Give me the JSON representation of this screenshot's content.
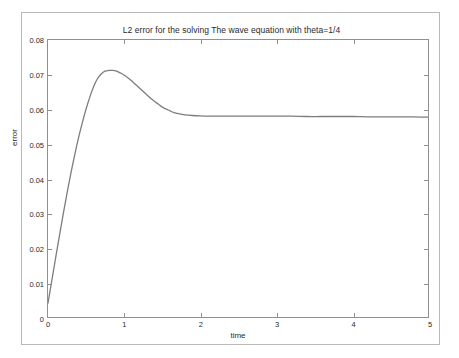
{
  "chart_data": {
    "type": "line",
    "title": "L2 error for the solving The wave equation with theta=1/4",
    "xlabel": "time",
    "ylabel": "error",
    "xlim": [
      0,
      5
    ],
    "ylim": [
      0,
      0.08
    ],
    "grid": false,
    "legend": null,
    "xticks": [
      "0",
      "1",
      "2",
      "3",
      "4",
      "5"
    ],
    "xtick_values": [
      0,
      1,
      2,
      3,
      4,
      5
    ],
    "yticks": [
      "0",
      "0.01",
      "0.02",
      "0.03",
      "0.04",
      "0.05",
      "0.06",
      "0.07",
      "0.08"
    ],
    "ytick_values": [
      0,
      0.01,
      0.02,
      0.03,
      0.04,
      0.05,
      0.06,
      0.07,
      0.08
    ],
    "line_color": "#7d7d7d",
    "line_width": 1.3,
    "series": [
      {
        "name": "L2 error",
        "x": [
          0.0,
          0.05,
          0.1,
          0.15,
          0.2,
          0.25,
          0.3,
          0.35,
          0.4,
          0.45,
          0.5,
          0.55,
          0.6,
          0.65,
          0.7,
          0.75,
          0.8,
          0.85,
          0.9,
          0.95,
          1.0,
          1.05,
          1.1,
          1.15,
          1.2,
          1.25,
          1.3,
          1.35,
          1.4,
          1.45,
          1.5,
          1.55,
          1.6,
          1.65,
          1.7,
          1.75,
          1.8,
          1.9,
          2.0,
          2.2,
          2.4,
          2.6,
          2.8,
          3.0,
          3.2,
          3.4,
          3.6,
          3.8,
          4.0,
          4.2,
          4.4,
          4.6,
          4.8,
          5.0
        ],
        "y": [
          0.004,
          0.0105,
          0.017,
          0.0234,
          0.0297,
          0.0357,
          0.0414,
          0.0467,
          0.0516,
          0.056,
          0.06,
          0.0635,
          0.0665,
          0.0688,
          0.0702,
          0.071,
          0.0712,
          0.0712,
          0.071,
          0.0705,
          0.0699,
          0.0691,
          0.0682,
          0.0672,
          0.0662,
          0.0652,
          0.0642,
          0.0632,
          0.0623,
          0.0615,
          0.0607,
          0.0601,
          0.0596,
          0.0591,
          0.0588,
          0.0586,
          0.0584,
          0.0582,
          0.0581,
          0.058,
          0.058,
          0.058,
          0.058,
          0.058,
          0.058,
          0.0579,
          0.0579,
          0.0579,
          0.0579,
          0.0578,
          0.0578,
          0.0578,
          0.0578,
          0.0577
        ]
      }
    ],
    "annotations": {
      "peak_value": 0.0712,
      "peak_time": 0.85,
      "start_value": 0.004,
      "steady_state": 0.0578
    }
  }
}
